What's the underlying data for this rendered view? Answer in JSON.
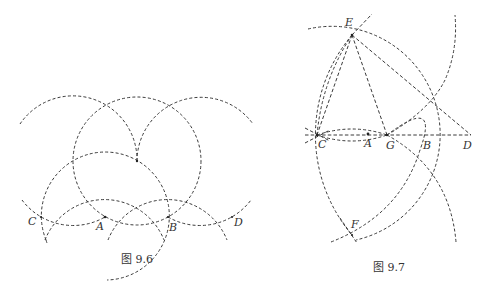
{
  "figures": [
    {
      "id": "fig-9-6",
      "caption": "图 9.6",
      "points": [
        {
          "label": "C"
        },
        {
          "label": "A"
        },
        {
          "label": "B"
        },
        {
          "label": "D"
        }
      ]
    },
    {
      "id": "fig-9-7",
      "caption": "图 9.7",
      "points": [
        {
          "label": "E"
        },
        {
          "label": "C"
        },
        {
          "label": "A"
        },
        {
          "label": "G"
        },
        {
          "label": "B"
        },
        {
          "label": "D"
        },
        {
          "label": "F"
        }
      ]
    }
  ],
  "style": {
    "stroke_color": "#3a3a3a",
    "text_color": "#333333",
    "background": "#ffffff"
  }
}
